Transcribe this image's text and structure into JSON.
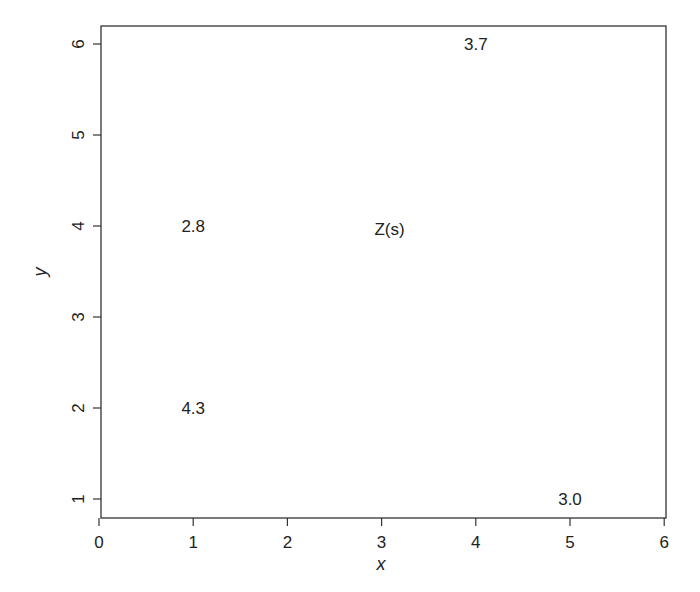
{
  "chart_data": {
    "type": "scatter",
    "title": "",
    "xlabel": "x",
    "ylabel": "y",
    "xlim": [
      0,
      6
    ],
    "ylim": [
      0.8,
      6.2
    ],
    "grid": false,
    "x_ticks": [
      "0",
      "1",
      "2",
      "3",
      "4",
      "5",
      "6"
    ],
    "y_ticks": [
      "1",
      "2",
      "3",
      "4",
      "5",
      "6"
    ],
    "points": [
      {
        "x": 1,
        "y": 4,
        "label": "2.8"
      },
      {
        "x": 1,
        "y": 2,
        "label": "4.3"
      },
      {
        "x": 4,
        "y": 6,
        "label": "3.7"
      },
      {
        "x": 5,
        "y": 1,
        "label": "3.0"
      }
    ],
    "annotations": [
      {
        "x": 3,
        "y": 4,
        "text": "Z(s)"
      }
    ]
  },
  "axes": {
    "x_title": "x",
    "y_title": "y"
  }
}
